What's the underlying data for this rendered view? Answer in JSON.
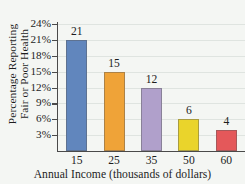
{
  "chart_data": {
    "type": "bar",
    "title": "",
    "categories": [
      "15",
      "25",
      "35",
      "50",
      "60"
    ],
    "values": [
      21,
      15,
      12,
      6,
      4
    ],
    "value_labels": [
      "21",
      "15",
      "12",
      "6",
      "4"
    ],
    "bar_colors": [
      "#6186bd",
      "#efa338",
      "#b0a0cb",
      "#ead42b",
      "#e4585a"
    ],
    "xlabel": "Annual Income (thousands of dollars)",
    "ylabel_line1": "Percentage Reporting",
    "ylabel_line2": "Fair or Poor Health",
    "ylim": [
      0,
      24
    ],
    "ytick_values": [
      3,
      6,
      9,
      12,
      15,
      18,
      21,
      24
    ],
    "ytick_labels": [
      "3%",
      "6%",
      "9%",
      "12%",
      "15%",
      "18%",
      "21%",
      "24%"
    ],
    "grid": true,
    "legend": "none",
    "background_color": "#f4f6f3",
    "axis_color": "#4a4a4a",
    "gridline_color": "#dfe4e0"
  }
}
